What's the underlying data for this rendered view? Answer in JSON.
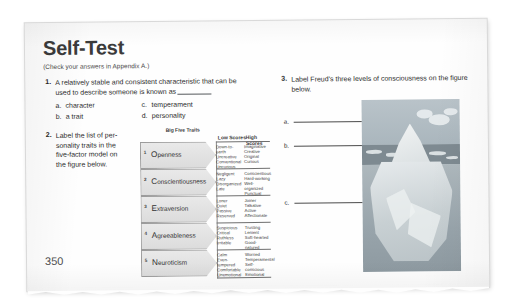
{
  "page": {
    "title": "Self-Test",
    "subtitle": "(Check your answers in Appendix A.)",
    "page_number": "350"
  },
  "questions": [
    {
      "number": "1.",
      "text_line1": "A relatively stable and consistent characteristic that can be",
      "text_line2": "used to describe someone is known as",
      "options": [
        {
          "letter": "a.",
          "label": "character"
        },
        {
          "letter": "b.",
          "label": "a trait"
        },
        {
          "letter": "c.",
          "label": "temperament"
        },
        {
          "letter": "d.",
          "label": "personality"
        }
      ]
    },
    {
      "number": "2.",
      "text_line1": "Label the list of per-",
      "text_line2": "sonality traits in the",
      "text_line3": "five-factor model on",
      "text_line4": "the figure below."
    },
    {
      "number": "3.",
      "text_line1": "Label Freud's three levels of consciousness on the figure",
      "text_line2": "below."
    }
  ],
  "big_five": {
    "figure_title": "Big Five Traits",
    "low_header": "Low Scores",
    "high_header": "High Scores",
    "rows": [
      {
        "index": "1",
        "initial": "O",
        "rest": "penness",
        "low": [
          "Down-to-earth",
          "Uncreative",
          "Conventional",
          "Uncurious"
        ],
        "high": [
          "Imaginative",
          "Creative",
          "Original",
          "Curious"
        ]
      },
      {
        "index": "2",
        "initial": "C",
        "rest": "onscientiousness",
        "low": [
          "Negligent",
          "Lazy",
          "Disorganized",
          "Late"
        ],
        "high": [
          "Conscientious",
          "Hard-working",
          "Well-organized",
          "Punctual"
        ]
      },
      {
        "index": "3",
        "initial": "E",
        "rest": "xtraversion",
        "low": [
          "Loner",
          "Quiet",
          "Passive",
          "Reserved"
        ],
        "high": [
          "Joiner",
          "Talkative",
          "Active",
          "Affectionate"
        ]
      },
      {
        "index": "4",
        "initial": "A",
        "rest": "greeableness",
        "low": [
          "Suspicious",
          "Critical",
          "Ruthless",
          "Irritable"
        ],
        "high": [
          "Trusting",
          "Lenient",
          "Soft-hearted",
          "Good-natured"
        ]
      },
      {
        "index": "5",
        "initial": "N",
        "rest": "euroticism",
        "low": [
          "Calm",
          "Even-tempered",
          "Comfortable",
          "Unemotional"
        ],
        "high": [
          "Worried",
          "Temperamental",
          "Self-conscious",
          "Emotional"
        ]
      }
    ]
  },
  "iceberg": {
    "labels": [
      {
        "letter": "a."
      },
      {
        "letter": "b."
      },
      {
        "letter": "c."
      }
    ]
  }
}
